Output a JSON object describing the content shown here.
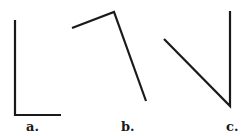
{
  "figures": [
    {
      "label": "a.",
      "points": [
        [
          15,
          20
        ],
        [
          15,
          115
        ],
        [
          61,
          115
        ]
      ]
    },
    {
      "label": "b.",
      "points": [
        [
          72,
          28
        ],
        [
          114,
          12
        ],
        [
          146,
          101
        ]
      ]
    },
    {
      "label": "c.",
      "points": [
        [
          164,
          39
        ],
        [
          230,
          106
        ],
        [
          230,
          11
        ]
      ]
    }
  ],
  "colors": {
    "stroke": "#1a1a1a",
    "background": "#ffffff"
  }
}
